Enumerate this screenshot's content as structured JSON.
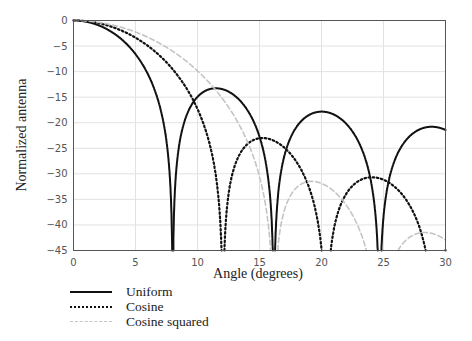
{
  "chart_data": {
    "type": "line",
    "title": "",
    "xlabel": "Angle (degrees)",
    "ylabel": "Normalized antenna",
    "xlim": [
      0,
      30
    ],
    "ylim": [
      -45,
      0
    ],
    "xticks": [
      0,
      5,
      10,
      15,
      20,
      25,
      30
    ],
    "yticks": [
      0,
      -5,
      -10,
      -15,
      -20,
      -25,
      -30,
      -35,
      -40,
      -45
    ],
    "ytick_labels": [
      "0",
      "−5",
      "−10",
      "−15",
      "−20",
      "−25",
      "−30",
      "−35",
      "−40",
      "−45"
    ],
    "grid": true,
    "legend_position": "below-left",
    "aperture_factor": 7.185,
    "series": [
      {
        "name": "Uniform",
        "style": "solid",
        "color": "#111111",
        "model": "uniform",
        "key_points": {
          "nulls_deg": [
            8.0,
            16.3,
            25.0
          ],
          "sidelobe_peaks": [
            [
              11.6,
              -13.3
            ],
            [
              20.3,
              -17.8
            ],
            [
              29.5,
              -20.5
            ]
          ]
        }
      },
      {
        "name": "Cosine",
        "style": "dotted",
        "color": "#111111",
        "model": "cosine",
        "key_points": {
          "nulls_deg": [
            12.1,
            20.8,
            29.5
          ],
          "sidelobe_peaks": [
            [
              15.8,
              -23.0
            ],
            [
              24.6,
              -30.7
            ]
          ]
        }
      },
      {
        "name": "Cosine squared",
        "style": "dashed",
        "color": "#bbbbbb",
        "model": "cosine_squared",
        "key_points": {
          "nulls_deg": [
            16.1,
            24.6
          ],
          "sidelobe_peaks": [
            [
              20.0,
              -31.5
            ],
            [
              29.5,
              -41.0
            ]
          ]
        }
      }
    ]
  }
}
